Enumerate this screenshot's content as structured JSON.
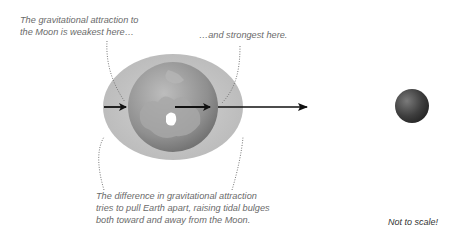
{
  "diagram": {
    "labels": {
      "weakest_line1": "The gravitational attraction to",
      "weakest_line2": "the Moon is weakest here…",
      "strongest": "…and strongest here.",
      "difference_line1": "The difference in gravitational attraction",
      "difference_line2": "tries to pull Earth apart, raising tidal bulges",
      "difference_line3": "both toward and away from the Moon.",
      "scale_note": "Not to scale!"
    },
    "elements": {
      "earth": "Earth globe (north polar view) with elongated tidal bulge ellipse",
      "moon": "Moon",
      "arrows": [
        "weak-force-arrow",
        "medium-force-arrow",
        "strong-force-arrow"
      ]
    },
    "colors": {
      "bulge": "#c4c4c4",
      "globe": "#9a9a9a",
      "arrow": "#111111",
      "text": "#6a6a6a",
      "moon": "#3a3a3a"
    }
  }
}
